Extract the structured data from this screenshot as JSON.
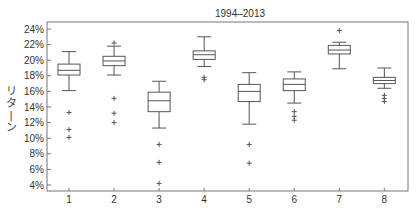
{
  "chart_data": {
    "type": "box",
    "title": "1994–2013",
    "xlabel": "",
    "ylabel": "リターン",
    "ylim": [
      3.4,
      24.9
    ],
    "yticks": [
      "4%",
      "6%",
      "8%",
      "10%",
      "12%",
      "14%",
      "16%",
      "18%",
      "20%",
      "22%",
      "24%"
    ],
    "ytick_values": [
      4,
      6,
      8,
      10,
      12,
      14,
      16,
      18,
      20,
      22,
      24
    ],
    "categories": [
      "1",
      "2",
      "3",
      "4",
      "5",
      "6",
      "7",
      "8"
    ],
    "grid": false,
    "legend": null,
    "boxes": [
      {
        "category": "1",
        "whisker_high": 21.1,
        "q3": 19.5,
        "median": 18.7,
        "q1": 18.1,
        "whisker_low": 16.1,
        "outliers": [
          13.3,
          11.1,
          10.1
        ]
      },
      {
        "category": "2",
        "whisker_high": 21.8,
        "q3": 20.5,
        "median": 19.9,
        "q1": 19.3,
        "whisker_low": 18.1,
        "outliers": [
          22.2,
          15.1,
          13.2,
          12.0
        ]
      },
      {
        "category": "3",
        "whisker_high": 17.3,
        "q3": 15.9,
        "median": 14.8,
        "q1": 13.4,
        "whisker_low": 11.3,
        "outliers": [
          9.2,
          6.9,
          4.2
        ]
      },
      {
        "category": "4",
        "whisker_high": 23.0,
        "q3": 21.2,
        "median": 20.7,
        "q1": 20.1,
        "whisker_low": 19.2,
        "outliers": [
          17.8,
          17.5
        ]
      },
      {
        "category": "5",
        "whisker_high": 18.4,
        "q3": 16.9,
        "median": 16.0,
        "q1": 14.7,
        "whisker_low": 11.8,
        "outliers": [
          9.2,
          6.8
        ]
      },
      {
        "category": "6",
        "whisker_high": 18.5,
        "q3": 17.6,
        "median": 16.9,
        "q1": 16.1,
        "whisker_low": 14.5,
        "outliers": [
          13.4,
          12.8,
          12.3
        ]
      },
      {
        "category": "7",
        "whisker_high": 22.3,
        "q3": 21.9,
        "median": 21.3,
        "q1": 20.8,
        "whisker_low": 18.9,
        "outliers": [
          23.8
        ]
      },
      {
        "category": "8",
        "whisker_high": 19.0,
        "q3": 17.8,
        "median": 17.4,
        "q1": 17.0,
        "whisker_low": 16.4,
        "outliers": [
          15.5,
          15.1,
          14.7
        ]
      }
    ]
  },
  "style": {
    "line_color": "#555555",
    "axis_color": "#666666",
    "text_color": "#333333"
  }
}
